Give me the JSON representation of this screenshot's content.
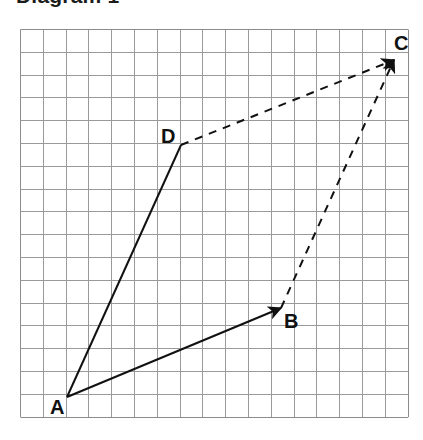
{
  "figure": {
    "title": "Diagram 1",
    "background_color": "#ffffff",
    "width": 423,
    "height": 440
  },
  "grid": {
    "name": "square-grid",
    "origin_x": 20,
    "origin_y": 29,
    "cell_size": 22.8,
    "columns": 17,
    "rows": 17,
    "line_color": "#9a9a9a",
    "line_width": 1,
    "border_color": "#8c8c8c"
  },
  "style": {
    "stroke_color": "#111111",
    "stroke_width": 2,
    "dash_pattern": "8 7",
    "label_color": "#111111",
    "label_font_size": 20
  },
  "points": [
    {
      "id": "A",
      "label": "A",
      "x": 67,
      "y": 397,
      "label_x": 50,
      "label_y": 414
    },
    {
      "id": "B",
      "label": "B",
      "x": 281,
      "y": 308,
      "label_x": 284,
      "label_y": 328
    },
    {
      "id": "C",
      "label": "C",
      "x": 394,
      "y": 60,
      "label_x": 394,
      "label_y": 50
    },
    {
      "id": "D",
      "label": "D",
      "x": 181,
      "y": 145,
      "label_x": 161,
      "label_y": 143
    }
  ],
  "vectors": [
    {
      "id": "AD",
      "from": "A",
      "to": "D",
      "style": "solid",
      "arrowhead": false,
      "label": "vector A to D"
    },
    {
      "id": "AB",
      "from": "A",
      "to": "B",
      "style": "solid",
      "arrowhead": true,
      "label": "vector A to B"
    },
    {
      "id": "DC",
      "from": "D",
      "to": "C",
      "style": "dashed",
      "arrowhead": true,
      "label": "vector D to C"
    },
    {
      "id": "BC",
      "from": "B",
      "to": "C",
      "style": "dashed",
      "arrowhead": true,
      "label": "vector B to C"
    }
  ]
}
